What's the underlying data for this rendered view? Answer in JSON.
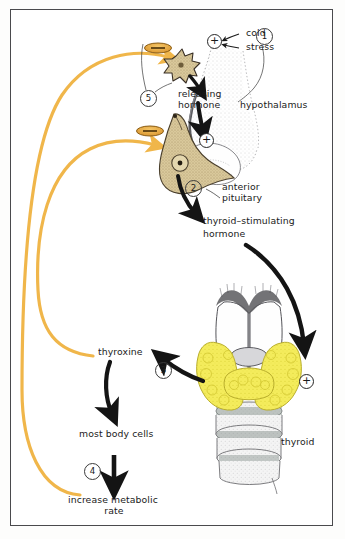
{
  "figure": {
    "colors": {
      "feedback_orange": "#f0b64a",
      "inhibition_oval": "#e8a33c",
      "thyroid_yellow": "#f2ea52",
      "pituitary_tan": "#cbb88a",
      "arrow_black": "#141414",
      "frame": "#4a4a4d",
      "background": "#ffffff"
    },
    "stimuli": {
      "cold_label": "cold",
      "stress_label": "stress",
      "stimulus_sign": "+"
    },
    "structures": {
      "hypothalamus_label": "hypothalamus",
      "anterior_pituitary_label": "anterior\npituitary",
      "anterior_pituitary_line1": "anterior",
      "anterior_pituitary_line2": "pituitary",
      "thyroid_label": "thyroid"
    },
    "hormones": {
      "releasing_hormone_line1": "releasing",
      "releasing_hormone_line2": "hormone",
      "tsh_line1": "thyroid–stimulating",
      "tsh_line2": "hormone",
      "thyroxine_label": "thyroxine"
    },
    "targets": {
      "body_cells_label": "most body cells",
      "metabolic_line1": "increase metabolic",
      "metabolic_line2": "rate"
    },
    "signs": {
      "pituitary_plus": "+",
      "thyroid_plus": "+",
      "negative_feedback": "−"
    },
    "steps": [
      {
        "id": "1",
        "number": "1",
        "meaning": "cold and stress stimulate hypothalamus"
      },
      {
        "id": "2",
        "number": "2",
        "meaning": "anterior pituitary releases TSH"
      },
      {
        "id": "3",
        "number": "3",
        "meaning": "thyroid secretes thyroxine"
      },
      {
        "id": "4",
        "number": "4",
        "meaning": "thyroxine increases metabolic rate in body cells"
      },
      {
        "id": "5",
        "number": "5",
        "meaning": "negative feedback inhibits hypothalamus and pituitary"
      }
    ]
  }
}
